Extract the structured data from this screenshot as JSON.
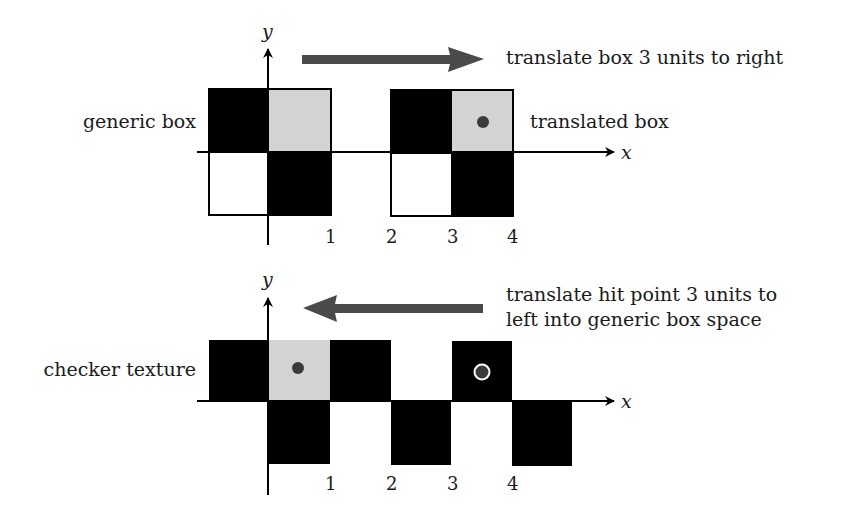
{
  "colors": {
    "black": "#000000",
    "gray_cell": "#d3d3d3",
    "arrow": "#4a4a4a",
    "dot": "#3a3a3a",
    "dot_ring": "#ffffff",
    "text": "#1a1a1a"
  },
  "top_panel": {
    "y_axis_label": "y",
    "x_axis_label": "x",
    "left_label": "generic box",
    "right_label": "translated box",
    "arrow_caption": "translate box 3 units to right",
    "arrow_direction": "right",
    "tick_labels": [
      "1",
      "2",
      "3",
      "4"
    ]
  },
  "bottom_panel": {
    "y_axis_label": "y",
    "x_axis_label": "x",
    "left_label": "checker texture",
    "arrow_caption_line1": "translate hit point 3 units to",
    "arrow_caption_line2": "left into generic box space",
    "arrow_direction": "left",
    "tick_labels": [
      "1",
      "2",
      "3",
      "4"
    ]
  }
}
